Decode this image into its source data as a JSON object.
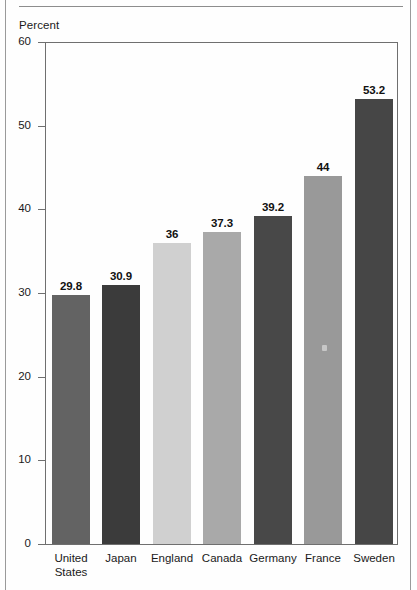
{
  "page": {
    "axis_title": "Percent"
  },
  "chart_data": {
    "type": "bar",
    "title": "",
    "subtitle": "",
    "xlabel": "",
    "ylabel": "Percent",
    "ylim": [
      0,
      60
    ],
    "yticks": [
      0,
      10,
      20,
      30,
      40,
      50,
      60
    ],
    "ytick_labels": [
      "0",
      "10",
      "20",
      "30",
      "40",
      "50",
      "60"
    ],
    "grid": false,
    "legend": "none",
    "categories": [
      "United\nStates",
      "Japan",
      "England",
      "Canada",
      "Germany",
      "France",
      "Sweden"
    ],
    "values": [
      29.8,
      30.9,
      36,
      37.3,
      39.2,
      44,
      53.2
    ],
    "value_labels": [
      "29.8",
      "30.9",
      "36",
      "37.3",
      "39.2",
      "44",
      "53.2"
    ],
    "bar_colors": [
      "#636363",
      "#3b3b3b",
      "#d0d0d0",
      "#a9a9a9",
      "#484848",
      "#999999",
      "#464646"
    ]
  }
}
